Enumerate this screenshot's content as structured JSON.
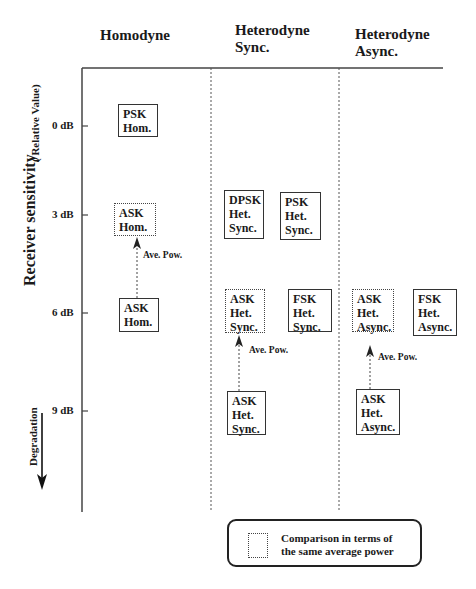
{
  "columns": [
    {
      "label": "Homodyne"
    },
    {
      "label": "Heterodyne\nSync."
    },
    {
      "label": "Heterodyne\nAsync."
    }
  ],
  "y_axis": {
    "title": "Receiver sensitivity",
    "subtitle": "( Relative Value)",
    "ticks": [
      "0 dB",
      "3 dB",
      "6 dB",
      "9 dB"
    ],
    "direction_label": "Degradation"
  },
  "boxes": {
    "psk_hom": "PSK\nHom.",
    "ask_hom_avg": "ASK\nHom.",
    "ask_hom": "ASK\nHom.",
    "dpsk_het_sync": "DPSK\nHet.\nSync.",
    "psk_het_sync": "PSK\nHet.\nSync.",
    "ask_het_sync_avg": "ASK\nHet.\nSync.",
    "fsk_het_sync": "FSK\nHet.\nSync.",
    "ask_het_sync": "ASK\nHet.\nSync.",
    "ask_het_async_avg": "ASK\nHet.\nAsync.",
    "fsk_het_async": "FSK\nHet.\nAsync.",
    "ask_het_async": "ASK\nHet.\nAsync."
  },
  "arrows": {
    "label": "Ave. Pow."
  },
  "legend": {
    "text": "Comparison in terms of\nthe same average power"
  }
}
